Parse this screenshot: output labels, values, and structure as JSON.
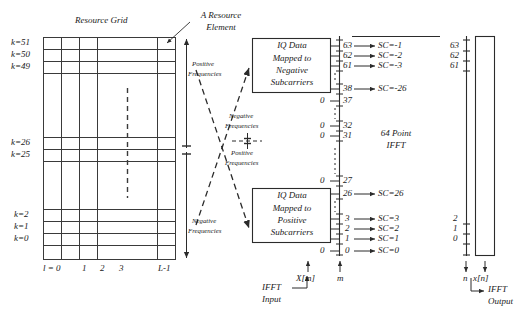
{
  "figure": {
    "title_resource_grid": "Resource Grid",
    "annotation_resource_element": [
      "A Resource",
      "Element"
    ]
  },
  "resource_grid": {
    "row_labels_top": [
      "k=51",
      "k=50",
      "k=49"
    ],
    "row_labels_mid": [
      "k=26",
      "k=25"
    ],
    "row_labels_bottom": [
      "k=2",
      "k=1",
      "k=0"
    ],
    "column_labels": [
      "l = 0",
      "1",
      "2",
      "3",
      "L-1"
    ],
    "vertical_ellipsis": "dashed"
  },
  "frequency_axis": {
    "positive_label": [
      "Positive",
      "Frequencies"
    ],
    "negative_label": [
      "Negative",
      "Frequencies"
    ]
  },
  "mapping": {
    "negative_label": [
      "Negative",
      "Frequencies"
    ],
    "positive_label": [
      "Positive",
      "Frequencies"
    ]
  },
  "boxes": {
    "negative_box": [
      "IQ Data",
      "Mapped to",
      "Negative",
      "Subcarriers"
    ],
    "positive_box": [
      "IQ Data",
      "Mapped to",
      "Positive",
      "Subcarriers"
    ]
  },
  "zero_labels": [
    "0",
    "0",
    "0",
    "0",
    "0"
  ],
  "ifft_input_column": {
    "entries": [
      {
        "index": "63",
        "sc": "SC=-1",
        "arrow": true
      },
      {
        "index": "62",
        "sc": "SC=-2",
        "arrow": true
      },
      {
        "index": "61",
        "sc": "SC=-3",
        "arrow": true
      },
      {
        "index": "38",
        "sc": "SC=-26",
        "arrow": true
      },
      {
        "index": "37",
        "sc": "",
        "arrow": false
      },
      {
        "index": "32",
        "sc": "",
        "arrow": false
      },
      {
        "index": "31",
        "sc": "",
        "arrow": false
      },
      {
        "index": "27",
        "sc": "",
        "arrow": false
      },
      {
        "index": "26",
        "sc": "SC=26",
        "arrow": true
      },
      {
        "index": "3",
        "sc": "SC=3",
        "arrow": true
      },
      {
        "index": "2",
        "sc": "SC=2",
        "arrow": true
      },
      {
        "index": "1",
        "sc": "SC=1",
        "arrow": true
      },
      {
        "index": "0",
        "sc": "SC=0",
        "arrow": true
      }
    ],
    "signal_label": "X[m]",
    "index_label": "m",
    "caption": [
      "IFFT",
      "Input"
    ]
  },
  "ifft_block": {
    "label": [
      "64 Point",
      "IFFT"
    ]
  },
  "ifft_output_column": {
    "entries": [
      "63",
      "62",
      "61",
      "2",
      "1",
      "0"
    ],
    "index_label": "n",
    "signal_label": "x[n]",
    "caption": [
      "IFFT",
      "Output"
    ]
  },
  "colors": {
    "stroke": "#2b2b2b",
    "grid": "#3a3a3a",
    "background": "#ffffff"
  }
}
